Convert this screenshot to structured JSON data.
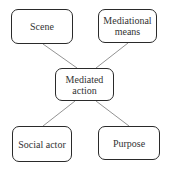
{
  "diagram": {
    "center": {
      "label_line1": "Mediated",
      "label_line2": "action"
    },
    "nodes": {
      "top_left": {
        "label": "Scene"
      },
      "top_right": {
        "label_line1": "Mediational",
        "label_line2": "means"
      },
      "bottom_left": {
        "label": "Social actor"
      },
      "bottom_right": {
        "label": "Purpose"
      }
    },
    "edges": [
      {
        "from": "Scene",
        "to": "Mediated action"
      },
      {
        "from": "Mediational means",
        "to": "Mediated action"
      },
      {
        "from": "Mediated action",
        "to": "Social actor"
      },
      {
        "from": "Mediated action",
        "to": "Purpose"
      }
    ],
    "colors": {
      "border": "#2a2a2a",
      "line": "#666666",
      "text": "#333333"
    }
  }
}
